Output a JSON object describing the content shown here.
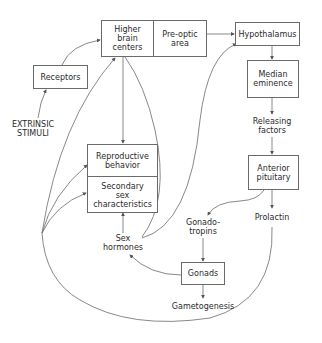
{
  "diagram": {
    "nodes": {
      "higher_brain_centers": "Higher\nbrain\ncenters",
      "preoptic_area": "Pre-optic\narea",
      "hypothalamus": "Hypothalamus",
      "receptors": "Receptors",
      "median_eminence": "Median\neminence",
      "releasing_factors": "Releasing\nfactors",
      "extrinsic_stimuli": "EXTRINSIC\nSTIMULI",
      "reproductive_behavior": "Reproductive\nbehavior",
      "secondary_sex_characteristics": "Secondary\nsex\ncharacteristics",
      "anterior_pituitary": "Anterior\npituitary",
      "gonadotropins": "Gonado-\ntropins",
      "prolactin": "Prolactin",
      "sex_hormones": "Sex\nhormones",
      "gonads": "Gonads",
      "gametogenesis": "Gametogenesis"
    },
    "edges": [
      {
        "from": "extrinsic_stimuli",
        "to": "receptors"
      },
      {
        "from": "receptors",
        "to": "higher_brain_centers"
      },
      {
        "from": "higher_brain_centers",
        "to": "reproductive_behavior"
      },
      {
        "from": "preoptic_area",
        "to": "hypothalamus"
      },
      {
        "from": "hypothalamus",
        "to": "median_eminence"
      },
      {
        "from": "median_eminence",
        "to": "releasing_factors"
      },
      {
        "from": "releasing_factors",
        "to": "anterior_pituitary"
      },
      {
        "from": "anterior_pituitary",
        "to": "gonadotropins"
      },
      {
        "from": "anterior_pituitary",
        "to": "prolactin"
      },
      {
        "from": "gonadotropins",
        "to": "gonads"
      },
      {
        "from": "gonads",
        "to": "gametogenesis"
      },
      {
        "from": "gonads",
        "to": "sex_hormones"
      },
      {
        "from": "sex_hormones",
        "to": "secondary_sex_characteristics"
      },
      {
        "from": "sex_hormones",
        "to": "preoptic_area"
      },
      {
        "from": "sex_hormones",
        "to": "hypothalamus"
      },
      {
        "from": "prolactin",
        "to": "higher_brain_centers"
      },
      {
        "from": "prolactin",
        "to": "reproductive_behavior"
      },
      {
        "from": "prolactin",
        "to": "secondary_sex_characteristics"
      }
    ]
  }
}
